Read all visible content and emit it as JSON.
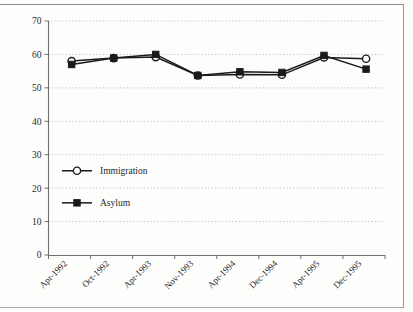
{
  "chart_data": {
    "type": "line",
    "title": "",
    "xlabel": "",
    "ylabel": "",
    "categories": [
      "Apr-1992",
      "Oct-1992",
      "Apr-1993",
      "Nov-1993",
      "Apr-1994",
      "Dec-1994",
      "Apr-1995",
      "Dec-1995"
    ],
    "series": [
      {
        "name": "Immigration",
        "marker": "open-circle",
        "color": "#1a1a1a",
        "values": [
          58.0,
          58.9,
          59.2,
          53.7,
          54.0,
          53.9,
          59.1,
          58.7
        ]
      },
      {
        "name": "Asylum",
        "marker": "filled-square",
        "color": "#1a1a1a",
        "values": [
          57.0,
          58.9,
          60.0,
          53.7,
          54.8,
          54.6,
          59.7,
          55.6
        ]
      }
    ],
    "ylim": [
      0,
      70
    ],
    "yticks": [
      0,
      10,
      20,
      30,
      40,
      50,
      60,
      70
    ],
    "ytick_labels": [
      "0",
      "10",
      "20",
      "30",
      "40",
      "50",
      "60",
      "70"
    ],
    "grid": "horizontal-dotted",
    "legend_position": "inside-left-middle"
  },
  "legend": {
    "entries": [
      {
        "label": "Immigration",
        "marker": "open-circle"
      },
      {
        "label": "Asylum",
        "marker": "filled-square"
      }
    ]
  },
  "colors": {
    "line": "#1a1a1a",
    "grid": "#b9b9b9",
    "axis": "#6f6f6f",
    "frame": "#9a9a9a",
    "background": "#fdfdfc"
  }
}
